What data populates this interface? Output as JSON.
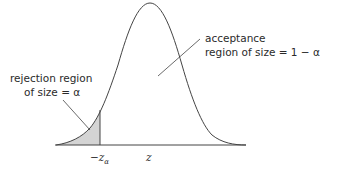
{
  "diagram": {
    "type": "normal-distribution-left-tail-test",
    "colors": {
      "curve": "#444444",
      "shade": "#d4d4d4",
      "text": "#2a2a2a"
    },
    "acceptance_label": {
      "line1": "acceptance",
      "line2": "region of size = 1 − α"
    },
    "rejection_label": {
      "line1": "rejection region",
      "line2": "of size = α"
    },
    "axis_labels": {
      "critical": "−z",
      "critical_subscript": "α",
      "variable": "z"
    }
  }
}
